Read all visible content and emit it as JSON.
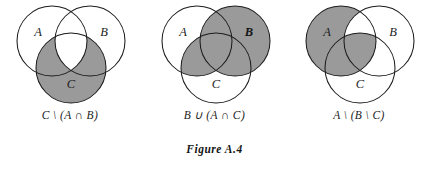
{
  "figure": {
    "label": "Figure A.4",
    "background_color": "#ffffff",
    "shade_color": "#9a9a9a",
    "stroke_color": "#1c1c1c",
    "text_color": "#1c1c1c"
  },
  "panels": [
    {
      "id": "panel-1",
      "caption": "C \\ (A ∩ B)",
      "labels": {
        "a": "A",
        "b": "B",
        "c": "C"
      },
      "shaded_description": "C minus the intersection of A and B",
      "shaded_regions": [
        "C_only",
        "A_and_C_only",
        "B_and_C_only"
      ]
    },
    {
      "id": "panel-2",
      "caption": "B ∪ (A ∩ C)",
      "labels": {
        "a": "A",
        "b": "B",
        "c": "C"
      },
      "shaded_description": "all of B united with the intersection of A and C",
      "shaded_regions": [
        "B_only",
        "A_and_B_only",
        "B_and_C_only",
        "A_and_B_and_C",
        "A_and_C_only"
      ]
    },
    {
      "id": "panel-3",
      "caption": "A \\ (B \\ C)",
      "labels": {
        "a": "A",
        "b": "B",
        "c": "C"
      },
      "shaded_description": "A minus the part of B lying outside C",
      "shaded_regions": [
        "A_only",
        "A_and_C_only",
        "A_and_B_and_C"
      ]
    }
  ]
}
